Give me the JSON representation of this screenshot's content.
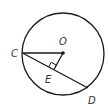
{
  "diagram": {
    "type": "geometry-circle",
    "labels": {
      "center": "O",
      "chord_start": "C",
      "chord_end": "D",
      "foot": "E"
    },
    "relations": [
      "OE ⊥ CD"
    ],
    "colors": {
      "stroke": "#1a1a1a",
      "label": "#333333"
    }
  }
}
